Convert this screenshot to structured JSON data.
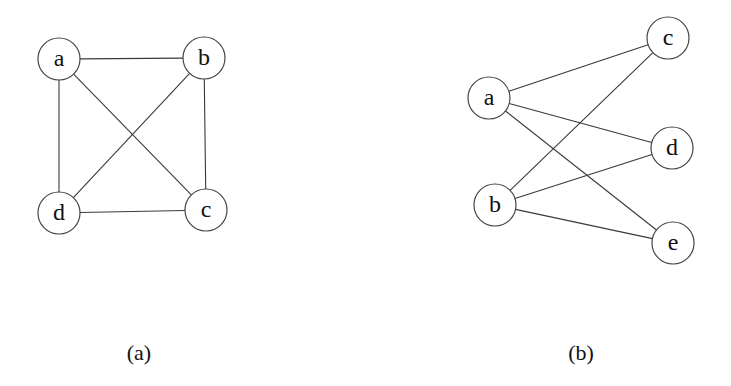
{
  "figure": {
    "node_radius": 21,
    "colors": {
      "stroke": "#444444",
      "text": "#111111",
      "background": "#ffffff"
    },
    "subfigures": [
      {
        "id": "a",
        "caption": "(a)",
        "caption_pos": [
          139,
          352
        ],
        "description": "Complete graph K4 on vertices a, b, c, d",
        "nodes": [
          {
            "id": "a",
            "label": "a",
            "x": 59,
            "y": 59
          },
          {
            "id": "b",
            "label": "b",
            "x": 204,
            "y": 58
          },
          {
            "id": "c",
            "label": "c",
            "x": 206,
            "y": 210
          },
          {
            "id": "d",
            "label": "d",
            "x": 59,
            "y": 213
          }
        ],
        "edges": [
          [
            "a",
            "b"
          ],
          [
            "a",
            "d"
          ],
          [
            "a",
            "c"
          ],
          [
            "b",
            "d"
          ],
          [
            "b",
            "c"
          ],
          [
            "d",
            "c"
          ]
        ]
      },
      {
        "id": "b",
        "caption": "(b)",
        "caption_pos": [
          581,
          352
        ],
        "description": "Complete bipartite graph K2,3 with parts {a, b} and {c, d, e}",
        "nodes": [
          {
            "id": "a",
            "label": "a",
            "x": 489,
            "y": 98
          },
          {
            "id": "b",
            "label": "b",
            "x": 495,
            "y": 205
          },
          {
            "id": "c",
            "label": "c",
            "x": 668,
            "y": 38
          },
          {
            "id": "d",
            "label": "d",
            "x": 672,
            "y": 148
          },
          {
            "id": "e",
            "label": "e",
            "x": 673,
            "y": 243
          }
        ],
        "edges": [
          [
            "a",
            "c"
          ],
          [
            "a",
            "d"
          ],
          [
            "a",
            "e"
          ],
          [
            "b",
            "c"
          ],
          [
            "b",
            "d"
          ],
          [
            "b",
            "e"
          ]
        ]
      }
    ]
  }
}
